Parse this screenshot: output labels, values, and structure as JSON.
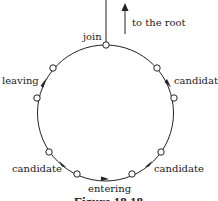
{
  "diagram": {
    "labels": {
      "to_root": "to the root",
      "join": "join",
      "leaving": "leaving",
      "candidate_right_top": "candidate",
      "candidate_left_bottom": "candidate",
      "candidate_right_bottom": "candidate",
      "entering": "entering"
    },
    "caption": "Figure 18.18",
    "colors": {
      "stroke": "#222222",
      "node_fill": "#ffffff",
      "text": "#1a1a1a"
    },
    "cycle": {
      "center": [
        105.5,
        113
      ],
      "radius": 68,
      "nodes": [
        {
          "name": "join",
          "x": 106,
          "y": 45
        },
        {
          "name": "upper-right",
          "x": 157,
          "y": 68
        },
        {
          "name": "right",
          "x": 174,
          "y": 98
        },
        {
          "name": "lower-right",
          "x": 161,
          "y": 152
        },
        {
          "name": "bottom-right",
          "x": 132,
          "y": 174
        },
        {
          "name": "bottom-left",
          "x": 77,
          "y": 174
        },
        {
          "name": "lower-left",
          "x": 49,
          "y": 152
        },
        {
          "name": "left",
          "x": 37,
          "y": 98
        },
        {
          "name": "upper-left",
          "x": 53,
          "y": 68
        }
      ]
    }
  }
}
